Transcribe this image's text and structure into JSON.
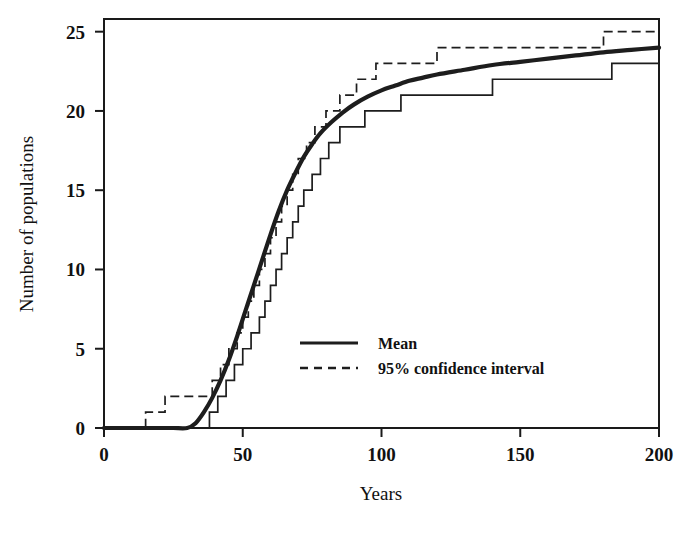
{
  "chart_data": {
    "type": "line",
    "title": "",
    "xlabel": "Years",
    "ylabel": "Number of populations",
    "xlim": [
      0,
      200
    ],
    "ylim": [
      0,
      25.8
    ],
    "grid": false,
    "legend_position": "inside-center-lower",
    "xticks": [
      0,
      50,
      100,
      150,
      200
    ],
    "xtick_labels": [
      "0",
      "50",
      "100",
      "150",
      "200"
    ],
    "yticks": [
      0,
      5,
      10,
      15,
      20,
      25
    ],
    "ytick_labels": [
      "0",
      "5",
      "10",
      "15",
      "20",
      "25"
    ],
    "series": [
      {
        "name": "Mean",
        "style": "solid-thick",
        "color": "#1d1d1d",
        "interpolation": "smooth",
        "x": [
          0,
          5,
          10,
          15,
          20,
          25,
          30,
          33,
          36,
          39,
          42,
          45,
          48,
          51,
          54,
          57,
          60,
          63,
          66,
          69,
          72,
          75,
          78,
          82,
          86,
          90,
          95,
          100,
          105,
          110,
          115,
          120,
          130,
          140,
          150,
          160,
          170,
          180,
          190,
          200
        ],
        "y": [
          0,
          0,
          0,
          0,
          0,
          0,
          0,
          0.3,
          1.0,
          1.9,
          3.0,
          4.3,
          5.8,
          7.4,
          9.0,
          10.6,
          12.2,
          13.7,
          15.0,
          16.1,
          17.1,
          17.9,
          18.6,
          19.3,
          19.9,
          20.4,
          20.9,
          21.3,
          21.6,
          21.9,
          22.1,
          22.3,
          22.6,
          22.9,
          23.1,
          23.3,
          23.5,
          23.7,
          23.85,
          24.0
        ]
      },
      {
        "name": "95% confidence interval upper",
        "style": "dashed-step",
        "color": "#1d1d1d",
        "interpolation": "step",
        "x": [
          0,
          15,
          22,
          35,
          39,
          42,
          45,
          48,
          50,
          52,
          54,
          56,
          58,
          60,
          62,
          64,
          66,
          68,
          70,
          73,
          76,
          80,
          85,
          91,
          98,
          107,
          120,
          150,
          180,
          200
        ],
        "y": [
          0,
          1,
          2,
          2,
          3,
          4,
          5,
          6,
          7,
          8,
          9,
          10,
          11,
          12,
          13,
          14,
          15,
          16,
          17,
          18,
          19,
          20,
          21,
          22,
          23,
          23,
          24,
          24,
          25,
          25
        ]
      },
      {
        "name": "95% confidence interval lower",
        "style": "solid-step",
        "color": "#1d1d1d",
        "interpolation": "step",
        "x": [
          0,
          35,
          38,
          41,
          44,
          47,
          50,
          53,
          56,
          58,
          60,
          62,
          64,
          66,
          68,
          70,
          72,
          75,
          78,
          81,
          85,
          89,
          94,
          100,
          107,
          116,
          127,
          140,
          157,
          183,
          200
        ],
        "y": [
          0,
          0,
          1,
          2,
          3,
          4,
          5,
          6,
          7,
          8,
          9,
          10,
          11,
          12,
          13,
          14,
          15,
          16,
          17,
          18,
          19,
          19,
          20,
          20,
          21,
          21,
          21,
          22,
          22,
          23,
          23
        ]
      }
    ],
    "legend": [
      {
        "label": "Mean",
        "style": "solid"
      },
      {
        "label": "95% confidence interval",
        "style": "dashed"
      }
    ]
  }
}
